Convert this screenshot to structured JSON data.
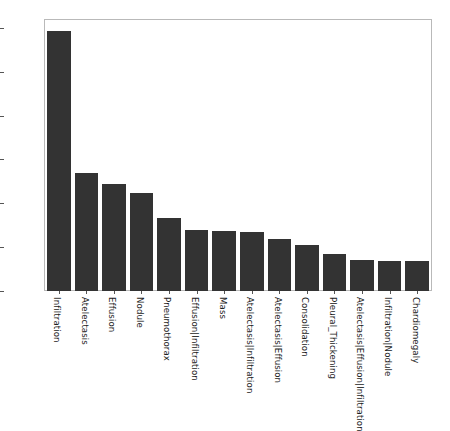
{
  "chart_data": {
    "type": "bar",
    "title": "",
    "xlabel": "",
    "ylabel": "",
    "ylim": [
      0,
      6200
    ],
    "yticks": [
      0,
      1000,
      2000,
      3000,
      4000,
      5000,
      6000
    ],
    "ytick_labels": [
      "0",
      "1000",
      "2000",
      "3000",
      "4000",
      "5000",
      "6000"
    ],
    "grid": false,
    "legend": false,
    "bar_color": "#333333",
    "xtick_rotation": 90,
    "categories": [
      "Infiltration",
      "Atelectasis",
      "Effusion",
      "Nodule",
      "Pneumothorax",
      "Effusion|Infiltration",
      "Mass",
      "Atelectasis|Infiltration",
      "Atelectasis|Effusion",
      "Consolidation",
      "Pleural_Thickening",
      "Atelectasis|Effusion|Infiltration",
      "Infiltration|Nodule",
      "Chardiomegaly"
    ],
    "values": [
      5950,
      2700,
      2450,
      2250,
      1670,
      1400,
      1370,
      1340,
      1180,
      1050,
      850,
      700,
      690,
      690
    ]
  }
}
